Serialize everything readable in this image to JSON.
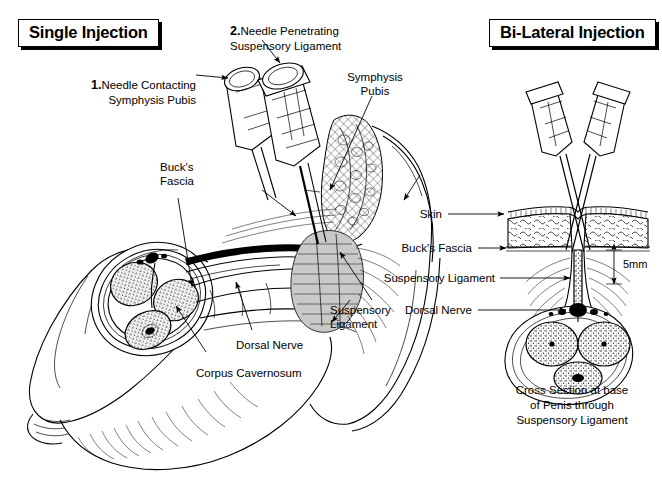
{
  "figure": {
    "title_left": "Single Injection",
    "title_right": "Bi-Lateral Injection"
  },
  "left_panel": {
    "title": "Single Injection",
    "callouts": [
      {
        "id": "needle-contacting",
        "step": "1.",
        "text": "Needle Contacting\nSymphysis Pubis"
      },
      {
        "id": "needle-penetrating",
        "step": "2.",
        "text": "Needle Penetrating\nSuspensory Ligament"
      }
    ],
    "anatomy_labels": [
      {
        "id": "symphysis-pubis",
        "text": "Symphysis\nPubis"
      },
      {
        "id": "bucks-fascia",
        "text": "Buck's\nFascia"
      },
      {
        "id": "suspensory-ligament",
        "text": "Suspensory\nLigament"
      },
      {
        "id": "dorsal-nerve",
        "text": "Dorsal Nerve"
      },
      {
        "id": "corpus-cavernosum",
        "text": "Corpus Cavernosum"
      }
    ]
  },
  "right_panel": {
    "title": "Bi-Lateral Injection",
    "anatomy_labels": [
      {
        "id": "skin",
        "text": "Skin"
      },
      {
        "id": "bucks-fascia",
        "text": "Buck's Fascia"
      },
      {
        "id": "suspensory-ligament",
        "text": "Suspensory Ligament"
      },
      {
        "id": "dorsal-nerve",
        "text": "Dorsal Nerve"
      }
    ],
    "measurement": "5mm",
    "caption": "Cross Section at base\nof Penis through\nSuspensory Ligament"
  },
  "colors": {
    "ink": "#000000",
    "background": "#ffffff",
    "shading_gray": "#c9c9c9"
  }
}
